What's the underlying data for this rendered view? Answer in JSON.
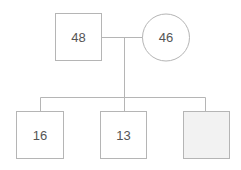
{
  "diagram": {
    "type": "family-tree",
    "colors": {
      "stroke": "#b5b5b5",
      "text": "#555555",
      "unknown_fill": "#f2f2f2"
    },
    "parents": [
      {
        "id": "father",
        "shape": "square",
        "label": "48"
      },
      {
        "id": "mother",
        "shape": "circle",
        "label": "46"
      }
    ],
    "children": [
      {
        "id": "child-1",
        "shape": "square",
        "label": "16"
      },
      {
        "id": "child-2",
        "shape": "square",
        "label": "13"
      },
      {
        "id": "child-3",
        "shape": "square",
        "label": "",
        "filled": true
      }
    ]
  }
}
